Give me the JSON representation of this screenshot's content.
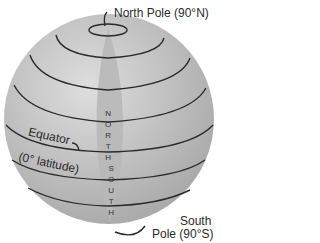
{
  "diagram": {
    "labels": {
      "north_pole": "North Pole (90°N)",
      "equator": "Equator",
      "equator_sub": "(0° latitude)",
      "south_pole_1": "South",
      "south_pole_2": "Pole (90°S)",
      "north_letters": [
        "N",
        "O",
        "R",
        "T",
        "H"
      ],
      "south_letters": [
        "S",
        "O",
        "U",
        "T",
        "H"
      ]
    },
    "colors": {
      "globe": "#c8c8c8",
      "band": "#b4b4b4",
      "lines": "#2a2a2a"
    }
  }
}
